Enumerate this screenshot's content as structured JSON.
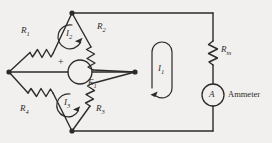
{
  "figure": {
    "type": "circuit-schematic",
    "background_color": "#f2f0ee",
    "line_color": "#2b2b2b"
  },
  "components": {
    "r1": {
      "label": "R",
      "sub": "1",
      "name": "resistor-r1"
    },
    "r2": {
      "label": "R",
      "sub": "2",
      "name": "resistor-r2"
    },
    "r3": {
      "label": "R",
      "sub": "3",
      "name": "resistor-r3"
    },
    "r4": {
      "label": "R",
      "sub": "4",
      "name": "resistor-r4"
    },
    "rm": {
      "label": "R",
      "sub": "m",
      "name": "resistor-rm"
    },
    "source": {
      "label": "E",
      "sub": "1",
      "polarity": "+",
      "name": "voltage-source-e1"
    },
    "ammeter": {
      "symbol": "A",
      "caption": "Ammeter",
      "name": "ammeter"
    }
  },
  "currents": {
    "i1": {
      "label": "I",
      "sub": "1",
      "direction": "counterclockwise"
    },
    "i2": {
      "label": "I",
      "sub": "2",
      "direction": "counterclockwise"
    },
    "i3": {
      "label": "I",
      "sub": "3",
      "direction": "counterclockwise"
    }
  }
}
